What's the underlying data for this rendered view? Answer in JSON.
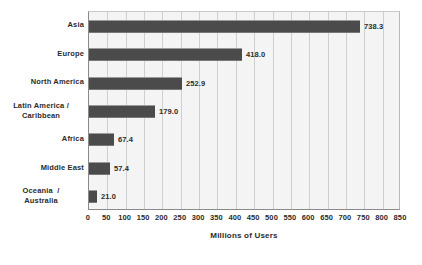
{
  "chart_data": {
    "type": "bar",
    "orientation": "horizontal",
    "title": "",
    "xlabel": "Millions of Users",
    "ylabel": "",
    "xlim": [
      0,
      850
    ],
    "grid": true,
    "legend": false,
    "categories": [
      "Asia",
      "Europe",
      "North America",
      "Latin America / Caribbean",
      "Africa",
      "Middle East",
      "Oceania / Australia"
    ],
    "values": [
      738.3,
      418.0,
      252.9,
      179.0,
      67.4,
      57.4,
      21.0
    ],
    "value_labels": [
      "738.3",
      "418.0",
      "252.9",
      "179.0",
      "67.4",
      "57.4",
      "21.0"
    ],
    "xticks": [
      0,
      50,
      100,
      150,
      200,
      250,
      300,
      350,
      400,
      450,
      500,
      550,
      600,
      650,
      700,
      750,
      800,
      850
    ],
    "xtick_labels": [
      "0",
      "50",
      "100",
      "150",
      "200",
      "250",
      "300",
      "350",
      "400",
      "450",
      "500",
      "550",
      "600",
      "650",
      "700",
      "750",
      "800",
      "850"
    ],
    "bar_color": "#4b4b4b",
    "plot_background": "#f4f4f4",
    "gridline_color": "#cfcfcf",
    "text_color": "#2b2b2b"
  },
  "category_labels": [
    {
      "lines": [
        "Asia"
      ]
    },
    {
      "lines": [
        "Europe"
      ]
    },
    {
      "lines": [
        "North America"
      ]
    },
    {
      "lines": [
        "Latin America /",
        "Caribbean"
      ]
    },
    {
      "lines": [
        "Africa"
      ]
    },
    {
      "lines": [
        "Middle East"
      ]
    },
    {
      "lines": [
        "Oceania  /",
        "Australia"
      ]
    }
  ],
  "axis": {
    "x_title": "Millions of Users"
  }
}
